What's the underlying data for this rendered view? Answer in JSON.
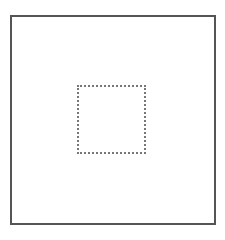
{
  "diagram": {
    "outer_frame": {
      "shape": "rectangle",
      "stroke": "solid",
      "color": "#555555"
    },
    "inner_square": {
      "shape": "square",
      "stroke": "dotted",
      "color": "#777777"
    }
  }
}
